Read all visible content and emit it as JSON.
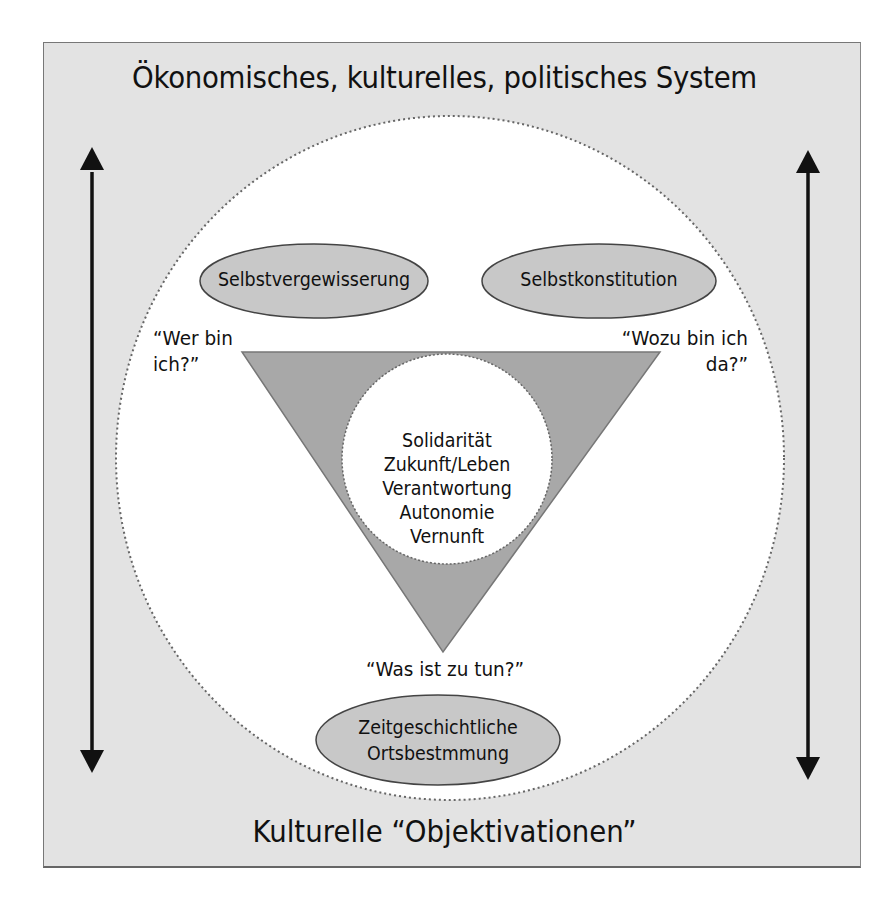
{
  "diagram": {
    "top_label": "Ökonomisches, kulturelles, politisches System",
    "bottom_label": "Kulturelle “Objektivationen”",
    "ellipses": {
      "left": "Selbstvergewisserung",
      "right": "Selbstkonstitution",
      "bottom_line1": "Zeitgeschichtliche",
      "bottom_line2": "Ortsbestmmung"
    },
    "questions": {
      "left_line1": "“Wer bin",
      "left_line2": "ich?”",
      "right_line1": "“Wozu bin ich",
      "right_line2": "da?”",
      "bottom": "“Was ist zu tun?”"
    },
    "core_values": [
      "Solidarität",
      "Zukunft/Leben",
      "Verantwortung",
      "Autonomie",
      "Vernunft"
    ],
    "arrows": {
      "left": "double-headed vertical arrow",
      "right": "double-headed vertical arrow"
    },
    "colors": {
      "background_frame": "#e3e3e3",
      "circle_fill": "#ffffff",
      "triangle_fill": "#a8a8a8",
      "ellipse_fill": "#c8c8c8",
      "outline": "#555555",
      "arrow": "#111111"
    }
  }
}
